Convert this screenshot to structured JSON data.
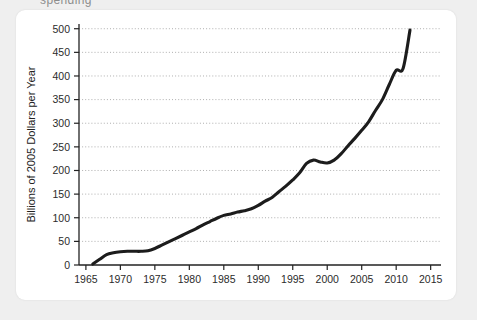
{
  "page": {
    "background_color": "#efefef",
    "card_background": "#ffffff",
    "cut_off_header_text": "spending"
  },
  "chart_data": {
    "type": "line",
    "title": "",
    "xlabel": "Year",
    "ylabel": "Billions of 2005 Dollars per Year",
    "xlim": [
      1964,
      2016.5
    ],
    "ylim": [
      0,
      510
    ],
    "grid": true,
    "legend": null,
    "line_color": "#1c1c1c",
    "grid_color": "#9a9a9a",
    "axis_color": "#222222",
    "xticks": [
      1965,
      1970,
      1975,
      1980,
      1985,
      1990,
      1995,
      2000,
      2005,
      2010,
      2015
    ],
    "xtick_labels": [
      "1965",
      "1970",
      "1975",
      "1980",
      "1985",
      "1990",
      "1995",
      "2000",
      "2005",
      "2010",
      "2015"
    ],
    "yticks": [
      0,
      50,
      100,
      150,
      200,
      250,
      300,
      350,
      400,
      450,
      500
    ],
    "ytick_labels": [
      "0",
      "50",
      "100",
      "150",
      "200",
      "250",
      "300",
      "350",
      "400",
      "450",
      "500"
    ],
    "series": [
      {
        "name": "Spending",
        "x": [
          1966,
          1967,
          1968,
          1969,
          1970,
          1971,
          1972,
          1973,
          1974,
          1975,
          1976,
          1977,
          1978,
          1979,
          1980,
          1981,
          1982,
          1983,
          1984,
          1985,
          1986,
          1987,
          1988,
          1989,
          1990,
          1991,
          1992,
          1993,
          1994,
          1995,
          1996,
          1997,
          1998,
          1999,
          2000,
          2001,
          2002,
          2003,
          2004,
          2005,
          2006,
          2007,
          2008,
          2009,
          2010,
          2011,
          2012
        ],
        "y": [
          2,
          12,
          22,
          26,
          28,
          29,
          29,
          29,
          30,
          35,
          42,
          49,
          56,
          63,
          70,
          77,
          85,
          92,
          99,
          105,
          108,
          112,
          115,
          119,
          126,
          135,
          143,
          155,
          167,
          180,
          195,
          215,
          222,
          218,
          216,
          222,
          235,
          252,
          268,
          285,
          303,
          327,
          350,
          382,
          412,
          416,
          497
        ]
      }
    ],
    "annotations": []
  }
}
